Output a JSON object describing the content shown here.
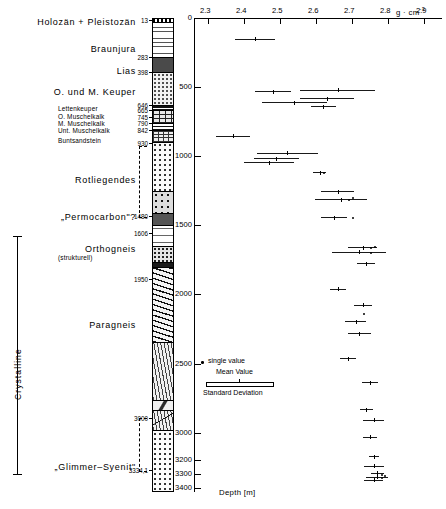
{
  "figure": {
    "units": [
      {
        "name": "Holozän + Pleistozän",
        "depth_top": 13,
        "style": "big",
        "y": 20,
        "label_y": 17
      },
      {
        "name": "Braunjura",
        "depth_top": 283,
        "style": "big",
        "y": 57,
        "label_y": 44
      },
      {
        "name": "Lias",
        "depth_top": 398,
        "style": "big",
        "y": 72,
        "label_y": 66
      },
      {
        "name": "O. und M. Keuper",
        "depth_top": 646,
        "style": "big",
        "y": 105,
        "label_y": 87
      },
      {
        "name": "Lettenkeuper",
        "depth_top": 665,
        "style": "small",
        "y": 108,
        "label_y": 105
      },
      {
        "name": "O. Muschelkalk",
        "depth_top": 745,
        "style": "small",
        "y": 118,
        "label_y": 113
      },
      {
        "name": "M. Muschelkalk",
        "depth_top": 790,
        "style": "small",
        "y": 124,
        "label_y": 120
      },
      {
        "name": "Unt. Muschelkalk",
        "depth_top": 842,
        "style": "small",
        "y": 131,
        "label_y": 127
      },
      {
        "name": "Buntsandstein",
        "depth_top": 930,
        "style": "small",
        "y": 143,
        "label_y": 137
      },
      {
        "name": "Rotliegendes",
        "depth_top": 1480,
        "style": "big",
        "y": 216,
        "label_y": 175
      },
      {
        "name": "„Permocarbon\"?",
        "depth_top": 1606,
        "style": "big",
        "y": 233,
        "label_y": 212
      },
      {
        "name": "Orthogneis",
        "depth_top": 1950,
        "style": "big",
        "y": 279,
        "label_y": 244
      },
      {
        "name": "(strukturell)",
        "depth_top": null,
        "style": "small",
        "y": 0,
        "label_y": 254
      },
      {
        "name": "Paragneis",
        "depth_top": 3000,
        "style": "big",
        "y": 418,
        "label_y": 320
      },
      {
        "name": "„Glimmer–Syenit\"",
        "depth_top": 3334.1,
        "style": "big",
        "y": 462,
        "label_y": 462
      }
    ],
    "core_depth_ticks": [
      {
        "label": "13",
        "y": 20
      },
      {
        "label": "283",
        "y": 57
      },
      {
        "label": "398",
        "y": 72
      },
      {
        "label": "646",
        "y": 105
      },
      {
        "label": "665",
        "y": 110
      },
      {
        "label": "745",
        "y": 117
      },
      {
        "label": "790",
        "y": 123
      },
      {
        "label": "842",
        "y": 130
      },
      {
        "label": "930",
        "y": 143
      },
      {
        "label": "1480",
        "y": 216
      },
      {
        "label": "1606",
        "y": 233
      },
      {
        "label": "1950",
        "y": 279
      },
      {
        "label": "3000",
        "y": 418
      },
      {
        "label": "3334,1",
        "y": 470
      }
    ],
    "brackets": [
      {
        "name": "rotliegendes-bracket",
        "top": 146,
        "height": 70,
        "x": 139
      },
      {
        "name": "glimmer-syenit-bracket",
        "top": 418,
        "height": 52,
        "x": 139
      }
    ],
    "crystalline_bracket": {
      "label": "Crystalline",
      "top": 236,
      "height": 238,
      "x": 17
    }
  },
  "chart_data": {
    "type": "scatter",
    "title": "",
    "xlabel": "g · cm",
    "xlabel_exp": "-3",
    "ylabel": "Depth [m]",
    "xlim": [
      2.3,
      2.9
    ],
    "ylim": [
      0,
      3400
    ],
    "grid": false,
    "xticks": [
      2.3,
      2.4,
      2.5,
      2.6,
      2.7,
      2.8,
      2.9
    ],
    "xticklabels": [
      "2.3",
      "2.4",
      "2.5",
      "2.6",
      "2.7",
      "2.8",
      "2.9"
    ],
    "yticks": [
      0,
      500,
      1000,
      1500,
      2000,
      2500,
      3000,
      3200,
      3300,
      3400
    ],
    "yticklabels": [
      "0",
      "500",
      "1000",
      "1500",
      "2000",
      "2500",
      "3000",
      "3200",
      "3300",
      "3400"
    ],
    "legend": {
      "position": "inside-lower-left",
      "entries": [
        "single value",
        "Mean Value",
        "Standard Deviation"
      ]
    },
    "series": [
      {
        "name": "Mean density with standard deviation",
        "points": [
          {
            "depth": 150,
            "mean": 2.43,
            "sd": 0.055
          },
          {
            "depth": 530,
            "mean": 2.48,
            "sd": 0.05
          },
          {
            "depth": 520,
            "mean": 2.66,
            "sd": 0.105
          },
          {
            "depth": 580,
            "mean": 2.63,
            "sd": 0.075
          },
          {
            "depth": 610,
            "mean": 2.54,
            "sd": 0.09
          },
          {
            "depth": 640,
            "mean": 2.62,
            "sd": 0.035
          },
          {
            "depth": 850,
            "mean": 2.37,
            "sd": 0.048
          },
          {
            "depth": 975,
            "mean": 2.52,
            "sd": 0.085
          },
          {
            "depth": 1015,
            "mean": 2.49,
            "sd": 0.062
          },
          {
            "depth": 1045,
            "mean": 2.47,
            "sd": 0.07
          },
          {
            "depth": 1115,
            "mean": 2.61,
            "sd": 0.018
          },
          {
            "depth": 1255,
            "mean": 2.66,
            "sd": 0.045
          },
          {
            "depth": 1310,
            "mean": 2.67,
            "sd": 0.072
          },
          {
            "depth": 1440,
            "mean": 2.65,
            "sd": 0.035
          },
          {
            "depth": 1660,
            "mean": 2.73,
            "sd": 0.04
          },
          {
            "depth": 1690,
            "mean": 2.72,
            "sd": 0.075
          },
          {
            "depth": 1775,
            "mean": 2.74,
            "sd": 0.025
          },
          {
            "depth": 1960,
            "mean": 2.66,
            "sd": 0.022
          },
          {
            "depth": 2075,
            "mean": 2.73,
            "sd": 0.025
          },
          {
            "depth": 2195,
            "mean": 2.71,
            "sd": 0.03
          },
          {
            "depth": 2280,
            "mean": 2.72,
            "sd": 0.032
          },
          {
            "depth": 2460,
            "mean": 2.69,
            "sd": 0.022
          },
          {
            "depth": 2635,
            "mean": 2.75,
            "sd": 0.022
          },
          {
            "depth": 2830,
            "mean": 2.74,
            "sd": 0.018
          },
          {
            "depth": 2905,
            "mean": 2.76,
            "sd": 0.03
          },
          {
            "depth": 3030,
            "mean": 2.75,
            "sd": 0.02
          },
          {
            "depth": 3170,
            "mean": 2.76,
            "sd": 0.014
          },
          {
            "depth": 3240,
            "mean": 2.76,
            "sd": 0.028
          },
          {
            "depth": 3290,
            "mean": 2.77,
            "sd": 0.018
          },
          {
            "depth": 3320,
            "mean": 2.77,
            "sd": 0.03
          },
          {
            "depth": 3340,
            "mean": 2.76,
            "sd": 0.026
          }
        ]
      },
      {
        "name": "single value",
        "points": [
          {
            "depth": 1120,
            "value": 2.62
          },
          {
            "depth": 1305,
            "value": 2.7
          },
          {
            "depth": 1315,
            "value": 2.69
          },
          {
            "depth": 1445,
            "value": 2.7
          },
          {
            "depth": 1655,
            "value": 2.76
          },
          {
            "depth": 1665,
            "value": 2.75
          },
          {
            "depth": 1700,
            "value": 2.75
          },
          {
            "depth": 2140,
            "value": 2.73
          },
          {
            "depth": 3305,
            "value": 2.78
          },
          {
            "depth": 3315,
            "value": 2.79
          },
          {
            "depth": 3330,
            "value": 2.78
          }
        ]
      }
    ]
  }
}
